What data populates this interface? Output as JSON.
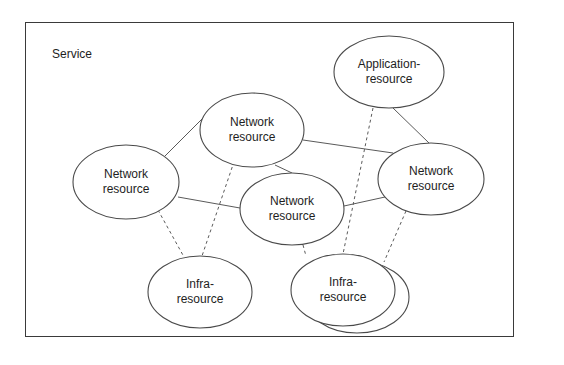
{
  "diagram": {
    "container": {
      "label": "Service"
    },
    "nodes": [
      {
        "id": "net-top",
        "line1": "Network",
        "line2": "resource",
        "type": "network",
        "cx": 252,
        "cy": 130,
        "rx": 52,
        "ry": 38
      },
      {
        "id": "app",
        "line1": "Application-",
        "line2": "resource",
        "type": "application",
        "cx": 389,
        "cy": 72,
        "rx": 55,
        "ry": 36
      },
      {
        "id": "net-left",
        "line1": "Network",
        "line2": "resource",
        "type": "network",
        "cx": 126,
        "cy": 182,
        "rx": 53,
        "ry": 37
      },
      {
        "id": "net-center",
        "line1": "Network",
        "line2": "resource",
        "type": "network",
        "cx": 292,
        "cy": 209,
        "rx": 52,
        "ry": 36
      },
      {
        "id": "net-right",
        "line1": "Network",
        "line2": "resource",
        "type": "network",
        "cx": 431,
        "cy": 179,
        "rx": 53,
        "ry": 36
      },
      {
        "id": "infra-left",
        "line1": "Infra-",
        "line2": "resource",
        "type": "infra",
        "cx": 200,
        "cy": 292,
        "rx": 52,
        "ry": 36
      },
      {
        "id": "infra-right",
        "line1": "Infra-",
        "line2": "resource",
        "type": "infra-stacked",
        "cx": 343,
        "cy": 290,
        "rx": 52,
        "ry": 36
      }
    ],
    "edges": [
      {
        "from": "net-left",
        "to": "net-top",
        "style": "solid"
      },
      {
        "from": "net-top",
        "to": "net-center",
        "style": "solid"
      },
      {
        "from": "net-top",
        "to": "net-right",
        "style": "solid"
      },
      {
        "from": "net-left",
        "to": "net-center",
        "style": "solid"
      },
      {
        "from": "net-center",
        "to": "net-right",
        "style": "solid"
      },
      {
        "from": "app",
        "to": "net-right",
        "style": "solid"
      },
      {
        "from": "net-left",
        "to": "infra-left",
        "style": "dashed"
      },
      {
        "from": "net-top",
        "to": "infra-left",
        "style": "dashed"
      },
      {
        "from": "net-center",
        "to": "infra-right",
        "style": "dashed"
      },
      {
        "from": "app",
        "to": "infra-right",
        "style": "dashed"
      },
      {
        "from": "net-right",
        "to": "infra-right",
        "style": "dashed"
      }
    ]
  }
}
